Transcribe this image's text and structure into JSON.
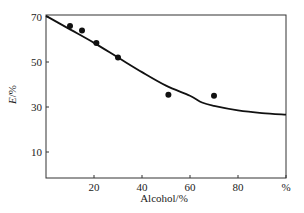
{
  "chart_data": {
    "type": "line",
    "title": "",
    "xlabel": "Alcohol/%",
    "ylabel": "E/%",
    "ylabel_italic_part": "E",
    "ylabel_rest": "/%",
    "xlim": [
      0,
      100
    ],
    "ylim": [
      0,
      70
    ],
    "x_ticks": [
      {
        "value": 20,
        "label": "20"
      },
      {
        "value": 40,
        "label": "40"
      },
      {
        "value": 60,
        "label": "60"
      },
      {
        "value": 80,
        "label": "80"
      },
      {
        "value": 100,
        "label": "%"
      }
    ],
    "y_ticks": [
      {
        "value": 10,
        "label": "10"
      },
      {
        "value": 30,
        "label": "30"
      },
      {
        "value": 50,
        "label": "50"
      },
      {
        "value": 70,
        "label": "70"
      }
    ],
    "grid": false,
    "legend": null,
    "series": [
      {
        "name": "measured",
        "kind": "scatter",
        "color": "#111111",
        "points": [
          {
            "x": 10,
            "y": 66
          },
          {
            "x": 15,
            "y": 64
          },
          {
            "x": 21,
            "y": 58.5
          },
          {
            "x": 30,
            "y": 52
          },
          {
            "x": 51,
            "y": 35.5
          },
          {
            "x": 70,
            "y": 35
          }
        ]
      },
      {
        "name": "fitted",
        "kind": "line",
        "color": "#111111",
        "points": [
          {
            "x": 0,
            "y": 70.5
          },
          {
            "x": 10,
            "y": 64.5
          },
          {
            "x": 20,
            "y": 58.5
          },
          {
            "x": 30,
            "y": 52
          },
          {
            "x": 40,
            "y": 45.5
          },
          {
            "x": 50,
            "y": 39.5
          },
          {
            "x": 60,
            "y": 35
          },
          {
            "x": 65,
            "y": 32
          },
          {
            "x": 70,
            "y": 30.5
          },
          {
            "x": 80,
            "y": 28.5
          },
          {
            "x": 90,
            "y": 27.3
          },
          {
            "x": 100,
            "y": 26.6
          }
        ]
      }
    ]
  }
}
